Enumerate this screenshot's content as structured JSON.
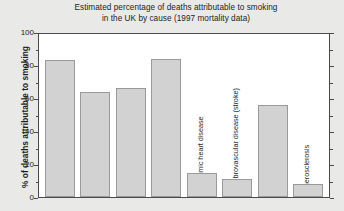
{
  "chart_data": {
    "type": "bar",
    "title": "Estimated percentage of deaths attributable to smoking in the UK by cause (1997 mortality data)",
    "title_lines": [
      "Estimated percentage of deaths attributable to smoking",
      "in the UK by cause (1997 mortality data)"
    ],
    "xlabel": "",
    "ylabel": "% of deaths attributable to smoking",
    "ylim": [
      0,
      100
    ],
    "ytick_labels": [
      "0",
      "20",
      "40",
      "60",
      "80",
      "100"
    ],
    "ytick_values": [
      0,
      20,
      40,
      60,
      80,
      100
    ],
    "yminor_values": [
      10,
      30,
      50,
      70,
      90
    ],
    "grid": false,
    "legend": "none",
    "categories": [
      "Lung cancer",
      "Upper respiratory cancer",
      "Oesophageal cancer",
      "Chronic obstructive lung disease",
      "Ischaemic heart disease",
      "Cerebrovascular disease (stroke)",
      "Aortic aneurysm",
      "Atherosclerosis"
    ],
    "values": [
      84,
      65,
      67,
      85,
      16,
      12,
      57,
      9
    ],
    "bar_color": "#d2d2d2",
    "bar_edge_color": "#9a9a9a",
    "plot_background": "#ffffff",
    "figure_background": "#e9e9e7",
    "axis_color": "#4a4a4a"
  }
}
